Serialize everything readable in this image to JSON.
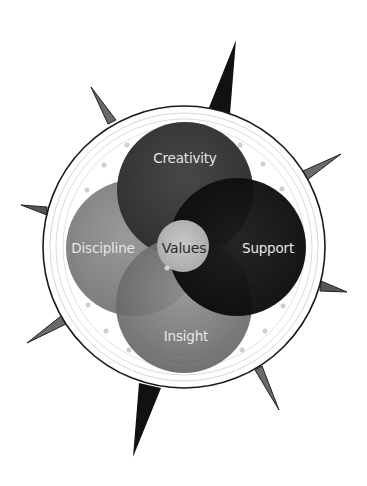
{
  "diagram": {
    "type": "compass-venn",
    "center_label": "Values",
    "circles": [
      {
        "id": "creativity",
        "label": "Creativity",
        "color": "#3e3e3e"
      },
      {
        "id": "discipline",
        "label": "Discipline",
        "color": "#8c8c8c"
      },
      {
        "id": "support",
        "label": "Support",
        "color": "#121212"
      },
      {
        "id": "insight",
        "label": "Insight",
        "color": "#7c7c7c"
      },
      {
        "id": "values",
        "label": "Values",
        "color": "#bfbfbf"
      }
    ],
    "colors": {
      "ring_outline": "#1a1a1a",
      "ring_inner": "#d4d4d4",
      "spike_major": "#111111",
      "spike_minor": "#6a6a6a",
      "label_light": "#e6e6e6",
      "label_dark": "#2a2a2a"
    }
  }
}
